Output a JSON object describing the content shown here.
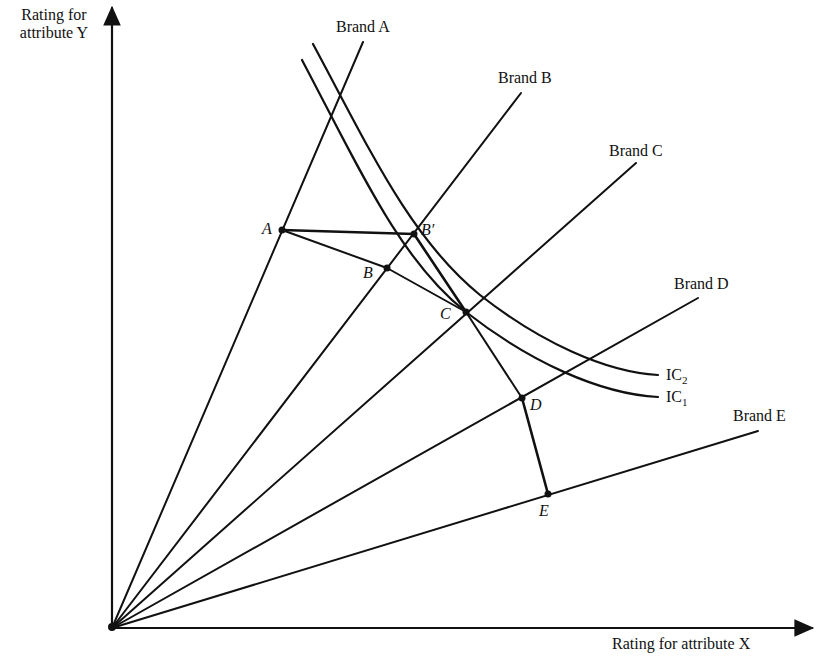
{
  "axes": {
    "y_label_line1": "Rating for",
    "y_label_line2": "attribute Y",
    "x_label": "Rating for attribute X"
  },
  "brands": [
    {
      "id": "A",
      "label": "Brand A"
    },
    {
      "id": "B",
      "label": "Brand B"
    },
    {
      "id": "C",
      "label": "Brand C"
    },
    {
      "id": "D",
      "label": "Brand D"
    },
    {
      "id": "E",
      "label": "Brand E"
    }
  ],
  "points": {
    "A": "A",
    "B": "B",
    "B_prime": "B′",
    "C": "C",
    "D": "D",
    "E": "E"
  },
  "curves": {
    "ic1": {
      "base": "IC",
      "sub": "1"
    },
    "ic2": {
      "base": "IC",
      "sub": "2"
    }
  },
  "colors": {
    "ink": "#111111",
    "background": "#ffffff"
  }
}
